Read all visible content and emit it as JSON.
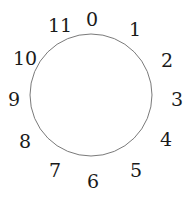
{
  "figure": {
    "kind": "clock-face-diagram",
    "background_color": "#ffffff",
    "width": 192,
    "height": 199
  },
  "circle": {
    "center_x": 91,
    "center_y": 95,
    "radius": 61,
    "stroke_color": "#7a7a7a",
    "stroke_width": 1,
    "fill": "none"
  },
  "labels": {
    "color": "#1a1a1a",
    "font_size_px": 19,
    "items": [
      {
        "text": "0",
        "x": 92,
        "y": 19
      },
      {
        "text": "1",
        "x": 135,
        "y": 29
      },
      {
        "text": "2",
        "x": 167,
        "y": 60
      },
      {
        "text": "3",
        "x": 177,
        "y": 99
      },
      {
        "text": "4",
        "x": 166,
        "y": 139
      },
      {
        "text": "5",
        "x": 136,
        "y": 170
      },
      {
        "text": "6",
        "x": 93,
        "y": 181
      },
      {
        "text": "7",
        "x": 55,
        "y": 170
      },
      {
        "text": "8",
        "x": 25,
        "y": 141
      },
      {
        "text": "9",
        "x": 14,
        "y": 99
      },
      {
        "text": "10",
        "x": 25,
        "y": 58
      },
      {
        "text": "11",
        "x": 60,
        "y": 25
      }
    ]
  }
}
